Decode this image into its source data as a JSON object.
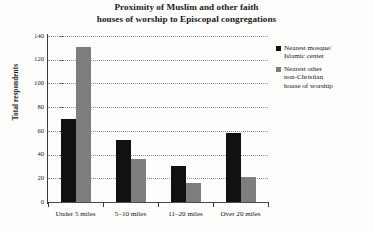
{
  "chart_data": {
    "type": "bar",
    "title": "Proximity of Muslim and other faith houses of worship to Episcopal congregations",
    "title_lines": [
      "Proximity of Muslim and other faith",
      "houses of worship to Episcopal congregations"
    ],
    "xlabel": "",
    "ylabel": "Total respondents",
    "categories": [
      "Under 5 miles",
      "5–10 miles",
      "11–20 miles",
      "Over 20 miles"
    ],
    "series": [
      {
        "name": "Nearest mosque/ Islamic center",
        "name_lines": [
          "Nearest mosque/",
          "Islamic center"
        ],
        "color": "#111111",
        "values": [
          70,
          52,
          30,
          58
        ]
      },
      {
        "name": "Nearest other non-Christian house of worship",
        "name_lines": [
          "Nearest other",
          "non-Christian",
          "house of worship"
        ],
        "color": "#7e7e7e",
        "values": [
          131,
          36,
          16,
          21
        ]
      }
    ],
    "ylim": [
      0,
      140
    ],
    "yticks": [
      0,
      20,
      40,
      60,
      80,
      100,
      120,
      140
    ],
    "ytick_labels": [
      "0",
      "20",
      "40",
      "60",
      "80",
      "100",
      "120",
      "140"
    ],
    "grid": true,
    "legend_position": "right"
  }
}
